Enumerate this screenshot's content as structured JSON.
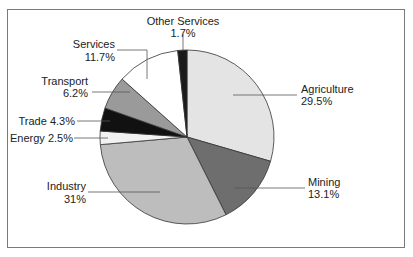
{
  "chart_data": {
    "type": "pie",
    "title": "",
    "start_angle_deg": 0,
    "direction": "clockwise",
    "categories": [
      "Agriculture",
      "Mining",
      "Industry",
      "Energy",
      "Trade",
      "Transport",
      "Services",
      "Other Services"
    ],
    "values": [
      29.5,
      13.1,
      31,
      2.5,
      4.3,
      6.2,
      11.7,
      1.7
    ],
    "unit": "%",
    "slices": [
      {
        "name": "Agriculture",
        "value": 29.5,
        "label": "Agriculture",
        "pct": "29.5%",
        "color": "#e4e4e4"
      },
      {
        "name": "Mining",
        "value": 13.1,
        "label": "Mining",
        "pct": "13.1%",
        "color": "#6e6e6e"
      },
      {
        "name": "Industry",
        "value": 31,
        "label": "Industry",
        "pct": "31%",
        "color": "#bdbdbd"
      },
      {
        "name": "Energy",
        "value": 2.5,
        "label": "Energy 2.5%",
        "pct": "2.5%",
        "color": "#f2f2f2"
      },
      {
        "name": "Trade",
        "value": 4.3,
        "label": "Trade 4.3%",
        "pct": "4.3%",
        "color": "#111111"
      },
      {
        "name": "Transport",
        "value": 6.2,
        "label": "Transport",
        "pct": "6.2%",
        "color": "#9a9a9a"
      },
      {
        "name": "Services",
        "value": 11.7,
        "label": "Services",
        "pct": "11.7%",
        "color": "#ffffff"
      },
      {
        "name": "Other Services",
        "value": 1.7,
        "label": "Other Services",
        "pct": "1.7%",
        "color": "#1a1a1a"
      }
    ],
    "legend": "none (direct labels with leader lines)"
  },
  "labels": {
    "other_services": {
      "name": "Other Services",
      "pct": "1.7%"
    },
    "services": {
      "name": "Services",
      "pct": "11.7%"
    },
    "transport": {
      "name": "Transport",
      "pct": "6.2%"
    },
    "trade": {
      "text": "Trade 4.3%"
    },
    "energy": {
      "text": "Energy 2.5%"
    },
    "industry": {
      "name": "Industry",
      "pct": "31%"
    },
    "agriculture": {
      "name": "Agriculture",
      "pct": "29.5%"
    },
    "mining": {
      "name": "Mining",
      "pct": "13.1%"
    }
  }
}
